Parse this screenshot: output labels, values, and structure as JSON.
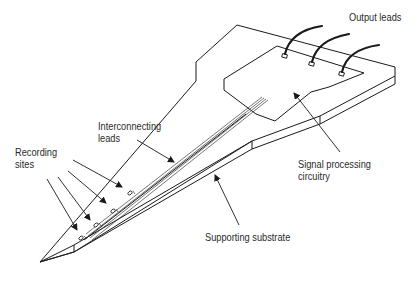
{
  "diagram": {
    "type": "labeled technical illustration",
    "labels": {
      "output_leads": "Output leads",
      "interconnecting_leads_line1": "Interconnecting",
      "interconnecting_leads_line2": "leads",
      "recording_sites_line1": "Recording",
      "recording_sites_line2": "sites",
      "signal_processing_line1": "Signal processing",
      "signal_processing_line2": "circuitry",
      "supporting_substrate": "Supporting substrate"
    },
    "components": [
      {
        "name": "Output leads",
        "count": 3
      },
      {
        "name": "Bond pads",
        "count": 3
      },
      {
        "name": "Signal processing circuitry",
        "count": 1
      },
      {
        "name": "Interconnecting leads",
        "count": 4
      },
      {
        "name": "Recording sites",
        "count": 4
      },
      {
        "name": "Supporting substrate",
        "count": 1
      }
    ],
    "colors": {
      "line": "#1a1a1a",
      "text": "#2a2a2a",
      "background": "#ffffff"
    }
  }
}
